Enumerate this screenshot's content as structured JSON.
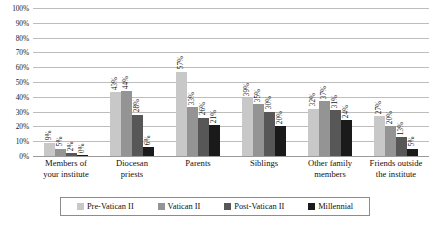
{
  "chart_data": {
    "type": "bar",
    "title": "",
    "subtitle": "",
    "xlabel": "",
    "ylabel": "",
    "ylim": [
      0,
      100
    ],
    "ytick_step": 10,
    "ytick_labels": [
      "0%",
      "10%",
      "20%",
      "30%",
      "40%",
      "50%",
      "60%",
      "70%",
      "80%",
      "90%",
      "100%"
    ],
    "grid": true,
    "legend_position": "bottom",
    "value_label_suffix": "%",
    "value_labels_rotated": true,
    "categories": [
      "Members of your institute",
      "Diocesan priests",
      "Parents",
      "Siblings",
      "Other family members",
      "Friends outside the institute"
    ],
    "category_lines": [
      [
        "Members of",
        "your institute"
      ],
      [
        "Diocesan",
        "priests"
      ],
      [
        "Parents",
        ""
      ],
      [
        "Siblings",
        ""
      ],
      [
        "Other family",
        "members"
      ],
      [
        "Friends outside",
        "the institute"
      ]
    ],
    "series": [
      {
        "name": "Pre-Vatican II",
        "color": "#c8c8c8",
        "values": [
          9,
          43,
          57,
          39,
          32,
          27
        ],
        "labels": [
          "9%",
          "43%",
          "57%",
          "39%",
          "32%",
          "27%"
        ]
      },
      {
        "name": "Vatican II",
        "color": "#949494",
        "values": [
          5,
          44,
          33,
          35,
          37,
          20
        ],
        "labels": [
          "5%",
          "44%",
          "33%",
          "35%",
          "37%",
          "20%"
        ]
      },
      {
        "name": "Post-Vatican II",
        "color": "#575757",
        "values": [
          2,
          28,
          26,
          30,
          31,
          13
        ],
        "labels": [
          "2%",
          "28%",
          "26%",
          "30%",
          "31%",
          "13%"
        ]
      },
      {
        "name": "Millennial",
        "color": "#1a1a1a",
        "values": [
          0,
          6,
          21,
          20,
          24,
          5
        ],
        "labels": [
          "0%",
          "6%",
          "21%",
          "20%",
          "24%",
          "5%"
        ]
      }
    ]
  },
  "colors": {
    "gridline": "#bdbdbd",
    "baseline": "#9a9a9a",
    "text": "#111111",
    "legend_border": "#8c8c8c",
    "background": "#ffffff"
  }
}
